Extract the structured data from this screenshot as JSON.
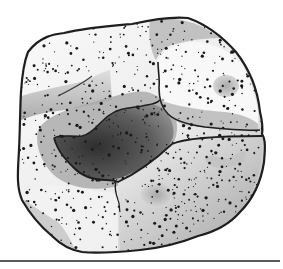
{
  "illustration": {
    "subject": "speckled rock",
    "width": 283,
    "height": 269,
    "colors": {
      "background": "#ffffff",
      "outline": "#1e1e1e",
      "surface_light": "#f7f7f7",
      "surface_mid": "#c9c9c9",
      "surface_shade": "#9a9a9a",
      "cavity_dark": "#3a3a3a",
      "cavity_mid": "#7d7d7d",
      "speckle": "#1a1a1a",
      "rule": "#5a5a5a"
    },
    "rule": {
      "x1": 0,
      "x2": 280,
      "y": 261,
      "thickness": 2
    },
    "speckles": {
      "count": 900,
      "seed": 7,
      "min_r": 0.6,
      "max_r": 1.7
    }
  }
}
